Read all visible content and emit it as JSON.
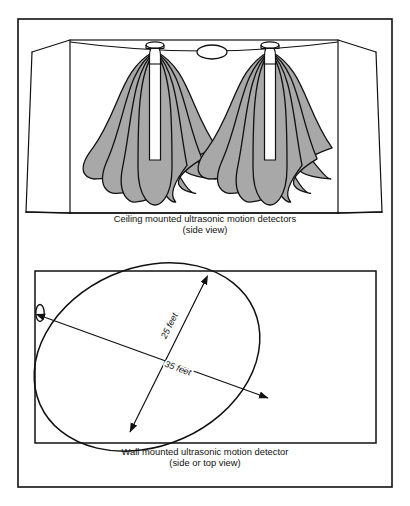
{
  "figure": {
    "background_color": "#ffffff",
    "ink_color": "#111111",
    "lobe_fill_color": "#a8a8a8",
    "frame": {
      "x": 18,
      "y": 19,
      "width": 374,
      "height": 468,
      "stroke_width": 1.6
    }
  },
  "panels": [
    {
      "id": "ceiling-panel",
      "caption_line_1": "Ceiling mounted ultrasonic motion detectors",
      "caption_line_2": "(side view)",
      "caption_x": 205,
      "caption_y_1": 222,
      "caption_y_2": 233,
      "room": {
        "back_wall": {
          "x": 70,
          "y": 40,
          "width": 268,
          "height": 173
        },
        "front_top_left": {
          "x": 32,
          "y": 52
        },
        "front_top_right": {
          "x": 376,
          "y": 52
        },
        "front_bottom_left": {
          "x": 26,
          "y": 212
        },
        "front_bottom_right": {
          "x": 382,
          "y": 212
        },
        "ceiling_sag_depth": 9
      },
      "detectors": [
        {
          "name": "detector-left",
          "cx": 155,
          "cap_y": 45,
          "body_top": 56,
          "body_bottom": 160,
          "body_half_width": 5.5,
          "cap_rx": 9,
          "cap_ry": 3.2,
          "lobe_count": 7,
          "lobe_max_half_width": 17,
          "lobe_spread": 66,
          "lobe_bottom": 205
        },
        {
          "name": "detector-right",
          "cx": 270,
          "cap_y": 45,
          "body_top": 56,
          "body_bottom": 160,
          "body_half_width": 5.5,
          "cap_rx": 9,
          "cap_ry": 3.2,
          "lobe_count": 7,
          "lobe_max_half_width": 17,
          "lobe_spread": 66,
          "lobe_bottom": 205
        }
      ],
      "center_ellipse": {
        "cx": 212,
        "cy": 52,
        "rx": 15,
        "ry": 7
      }
    },
    {
      "id": "wall-panel",
      "caption_line_1": "Wall mounted ultrasonic motion detector",
      "caption_line_2": "(side or top view)",
      "caption_x": 205,
      "caption_y_1": 455,
      "caption_y_2": 466,
      "room": {
        "x": 35,
        "y": 271,
        "width": 341,
        "height": 172
      },
      "wall_detector": {
        "cx": 40,
        "cy": 313,
        "rx": 4.2,
        "ry": 8.5
      },
      "coverage_ellipse": {
        "cx": 147,
        "cy": 357,
        "rx": 117,
        "ry": 89,
        "rotation_deg": -24
      },
      "dimensions": [
        {
          "name": "major-axis",
          "label": "35 feet",
          "value": 35,
          "unit": "feet",
          "x1": 44,
          "y1": 317,
          "x2": 268,
          "y2": 398,
          "label_x": 177,
          "label_y": 371,
          "label_rotation_deg": 20
        },
        {
          "name": "minor-axis",
          "label": "25 feet",
          "value": 25,
          "unit": "feet",
          "x1": 204,
          "y1": 283,
          "x2": 130,
          "y2": 432,
          "label_x": 172,
          "label_y": 327,
          "label_rotation_deg": -64
        }
      ]
    }
  ]
}
